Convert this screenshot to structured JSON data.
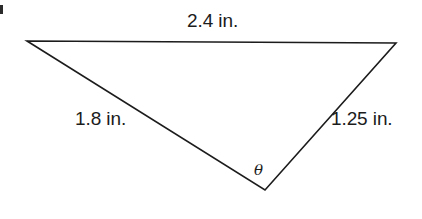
{
  "figure": {
    "kind": "triangle-diagram",
    "background_color": "#ffffff",
    "stroke_color": "#1c1c1c",
    "text_color": "#1c1c1c",
    "width": 422,
    "height": 219
  },
  "triangle": {
    "vertices": {
      "top_left": {
        "x": 27,
        "y": 41
      },
      "top_right": {
        "x": 396,
        "y": 43
      },
      "bottom": {
        "x": 265,
        "y": 190
      }
    },
    "points_attr": "27,41 396,43 265,190",
    "stroke_width": 1.6
  },
  "labels": {
    "top_side": "2.4 in.",
    "left_side": "1.8 in.",
    "right_side": "1.25 in.",
    "angle_symbol": "θ"
  },
  "artifact": {
    "name": "page-edge-mark",
    "color": "#2b2b2b"
  }
}
